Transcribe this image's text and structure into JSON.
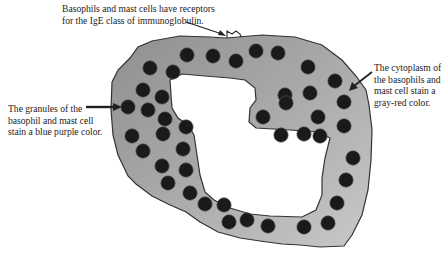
{
  "diagram": {
    "labels": {
      "receptor": {
        "lines": [
          "Basophils and mast cells have receptors",
          "for the IgE class of immunoglobulin."
        ]
      },
      "granules": {
        "lines": [
          "The granules of the",
          "basophil and mast cell",
          "stain a blue purple color."
        ]
      },
      "cytoplasm": {
        "lines": [
          "The cytoplasm of",
          "the basophils and",
          "mast cell stain a",
          "gray-red color."
        ]
      }
    },
    "colors": {
      "cytoplasm_fill": "#9c9c9c",
      "cytoplasm_fill_light": "#c4c4c4",
      "outline": "#333333",
      "granule": "#1a1a1a",
      "nucleus_fill": "#ffffff",
      "arrow": "#222222"
    },
    "granules": [
      [
        187,
        55
      ],
      [
        213,
        56
      ],
      [
        236,
        61
      ],
      [
        256,
        51
      ],
      [
        278,
        53
      ],
      [
        308,
        67
      ],
      [
        150,
        68
      ],
      [
        173,
        72
      ],
      [
        143,
        90
      ],
      [
        162,
        97
      ],
      [
        285,
        95
      ],
      [
        335,
        81
      ],
      [
        128,
        107
      ],
      [
        148,
        110
      ],
      [
        165,
        119
      ],
      [
        186,
        127
      ],
      [
        310,
        93
      ],
      [
        344,
        102
      ],
      [
        132,
        136
      ],
      [
        163,
        134
      ],
      [
        183,
        149
      ],
      [
        263,
        117
      ],
      [
        286,
        103
      ],
      [
        318,
        117
      ],
      [
        344,
        126
      ],
      [
        143,
        151
      ],
      [
        162,
        166
      ],
      [
        186,
        170
      ],
      [
        281,
        135
      ],
      [
        304,
        134
      ],
      [
        320,
        136
      ],
      [
        168,
        183
      ],
      [
        190,
        193
      ],
      [
        353,
        158
      ],
      [
        205,
        204
      ],
      [
        224,
        205
      ],
      [
        346,
        180
      ],
      [
        229,
        222
      ],
      [
        247,
        220
      ],
      [
        268,
        226
      ],
      [
        304,
        227
      ],
      [
        328,
        223
      ],
      [
        337,
        203
      ]
    ]
  }
}
